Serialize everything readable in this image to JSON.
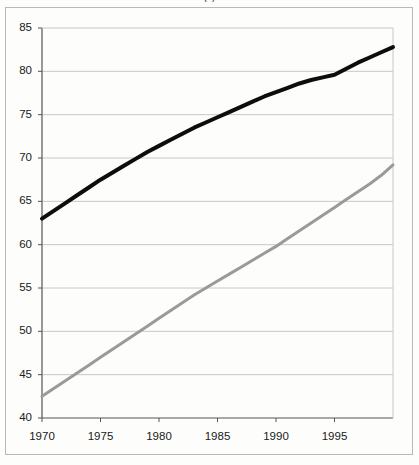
{
  "title": "(  )",
  "frame": {
    "visible": true,
    "border_color": "#b9b9b9"
  },
  "axis": {
    "y_ticks": [
      "85",
      "80",
      "75",
      "70",
      "65",
      "60",
      "55",
      "50",
      "45",
      "40"
    ],
    "x_ticks": [
      "1970",
      "1975",
      "1980",
      "1985",
      "1990",
      "1995"
    ]
  },
  "colors": {
    "series_upper": "#0d0d0d",
    "series_lower": "#9a9a9a",
    "gridline": "#c8c8c8",
    "axis": "#555555",
    "background": "#fdfdfc"
  },
  "chart_data": {
    "type": "line",
    "title": "(  )",
    "xlabel": "",
    "ylabel": "",
    "xlim": [
      1970,
      2000
    ],
    "ylim": [
      40,
      85
    ],
    "ytick_values": [
      40,
      45,
      50,
      55,
      60,
      65,
      70,
      75,
      80,
      85
    ],
    "xtick_values": [
      1970,
      1975,
      1980,
      1985,
      1990,
      1995
    ],
    "grid": "horizontal",
    "legend": "none",
    "x": [
      1970,
      1971,
      1972,
      1973,
      1974,
      1975,
      1976,
      1977,
      1978,
      1979,
      1980,
      1981,
      1982,
      1983,
      1984,
      1985,
      1986,
      1987,
      1988,
      1989,
      1990,
      1991,
      1992,
      1993,
      1994,
      1995,
      1996,
      1997,
      1998,
      1999,
      2000
    ],
    "series": [
      {
        "name": "upper-series",
        "color": "#0d0d0d",
        "line_width": 4,
        "values": [
          63.0,
          63.9,
          64.8,
          65.7,
          66.6,
          67.5,
          68.3,
          69.1,
          69.9,
          70.7,
          71.4,
          72.1,
          72.8,
          73.5,
          74.1,
          74.7,
          75.3,
          75.9,
          76.5,
          77.1,
          77.6,
          78.1,
          78.6,
          79.0,
          79.3,
          79.6,
          80.3,
          81.0,
          81.6,
          82.2,
          82.8
        ]
      },
      {
        "name": "lower-series",
        "color": "#9a9a9a",
        "line_width": 3,
        "values": [
          42.5,
          43.4,
          44.3,
          45.2,
          46.1,
          47.0,
          47.9,
          48.8,
          49.7,
          50.6,
          51.5,
          52.4,
          53.3,
          54.2,
          55.0,
          55.8,
          56.6,
          57.4,
          58.2,
          59.0,
          59.8,
          60.7,
          61.6,
          62.5,
          63.4,
          64.3,
          65.2,
          66.1,
          67.0,
          68.0,
          69.2
        ]
      }
    ]
  }
}
